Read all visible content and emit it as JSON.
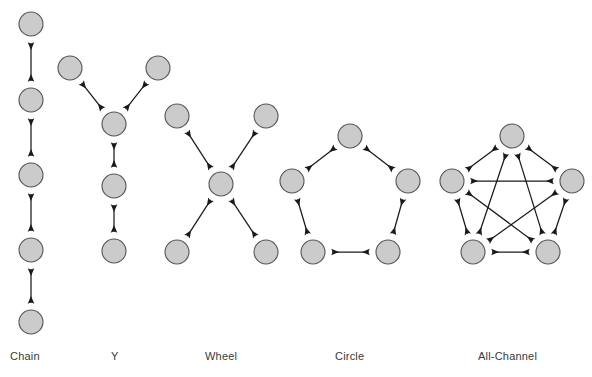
{
  "figure": {
    "background_color": "#ffffff",
    "node_fill_color": "#cbcbcb",
    "node_stroke_color": "#555555",
    "edge_color": "#1a1a1a",
    "label_color": "#3a3a3a",
    "node_radius": 12,
    "arrow_style": "double-headed"
  },
  "networks": [
    {
      "id": "chain",
      "label": "Chain",
      "label_x": 10,
      "label_y": 350,
      "node_count": 5,
      "edge_count": 4,
      "nodes": [
        {
          "id": "c1",
          "x": 31,
          "y": 24
        },
        {
          "id": "c2",
          "x": 31,
          "y": 100
        },
        {
          "id": "c3",
          "x": 31,
          "y": 175
        },
        {
          "id": "c4",
          "x": 31,
          "y": 250
        },
        {
          "id": "c5",
          "x": 31,
          "y": 322
        }
      ],
      "edges": [
        {
          "from": "c1",
          "to": "c2"
        },
        {
          "from": "c2",
          "to": "c3"
        },
        {
          "from": "c3",
          "to": "c4"
        },
        {
          "from": "c4",
          "to": "c5"
        }
      ]
    },
    {
      "id": "y",
      "label": "Y",
      "label_x": 111,
      "label_y": 350,
      "node_count": 5,
      "edge_count": 4,
      "nodes": [
        {
          "id": "y1",
          "x": 70,
          "y": 68
        },
        {
          "id": "y2",
          "x": 158,
          "y": 68
        },
        {
          "id": "y3",
          "x": 114,
          "y": 124
        },
        {
          "id": "y4",
          "x": 114,
          "y": 186
        },
        {
          "id": "y5",
          "x": 114,
          "y": 251
        }
      ],
      "edges": [
        {
          "from": "y1",
          "to": "y3"
        },
        {
          "from": "y2",
          "to": "y3"
        },
        {
          "from": "y3",
          "to": "y4"
        },
        {
          "from": "y4",
          "to": "y5"
        }
      ]
    },
    {
      "id": "wheel",
      "label": "Wheel",
      "label_x": 205,
      "label_y": 350,
      "node_count": 5,
      "edge_count": 4,
      "nodes": [
        {
          "id": "w1",
          "x": 177,
          "y": 116
        },
        {
          "id": "w2",
          "x": 266,
          "y": 116
        },
        {
          "id": "w3",
          "x": 221,
          "y": 184
        },
        {
          "id": "w4",
          "x": 177,
          "y": 252
        },
        {
          "id": "w5",
          "x": 266,
          "y": 252
        }
      ],
      "edges": [
        {
          "from": "w3",
          "to": "w1"
        },
        {
          "from": "w3",
          "to": "w2"
        },
        {
          "from": "w3",
          "to": "w4"
        },
        {
          "from": "w3",
          "to": "w5"
        }
      ]
    },
    {
      "id": "circle",
      "label": "Circle",
      "label_x": 335,
      "label_y": 350,
      "node_count": 5,
      "edge_count": 5,
      "nodes": [
        {
          "id": "r1",
          "x": 350,
          "y": 136
        },
        {
          "id": "r2",
          "x": 408,
          "y": 181
        },
        {
          "id": "r3",
          "x": 388,
          "y": 252
        },
        {
          "id": "r4",
          "x": 313,
          "y": 252
        },
        {
          "id": "r5",
          "x": 292,
          "y": 181
        }
      ],
      "edges": [
        {
          "from": "r1",
          "to": "r2"
        },
        {
          "from": "r2",
          "to": "r3"
        },
        {
          "from": "r3",
          "to": "r4"
        },
        {
          "from": "r4",
          "to": "r5"
        },
        {
          "from": "r5",
          "to": "r1"
        }
      ]
    },
    {
      "id": "all-channel",
      "label": "All-Channel",
      "label_x": 478,
      "label_y": 350,
      "node_count": 5,
      "edge_count": 10,
      "nodes": [
        {
          "id": "a1",
          "x": 512,
          "y": 136
        },
        {
          "id": "a2",
          "x": 572,
          "y": 181
        },
        {
          "id": "a3",
          "x": 548,
          "y": 252
        },
        {
          "id": "a4",
          "x": 473,
          "y": 252
        },
        {
          "id": "a5",
          "x": 452,
          "y": 181
        }
      ],
      "edges": [
        {
          "from": "a1",
          "to": "a2"
        },
        {
          "from": "a2",
          "to": "a3"
        },
        {
          "from": "a3",
          "to": "a4"
        },
        {
          "from": "a4",
          "to": "a5"
        },
        {
          "from": "a5",
          "to": "a1"
        },
        {
          "from": "a1",
          "to": "a3"
        },
        {
          "from": "a1",
          "to": "a4"
        },
        {
          "from": "a2",
          "to": "a4"
        },
        {
          "from": "a2",
          "to": "a5"
        },
        {
          "from": "a3",
          "to": "a5"
        }
      ]
    }
  ]
}
